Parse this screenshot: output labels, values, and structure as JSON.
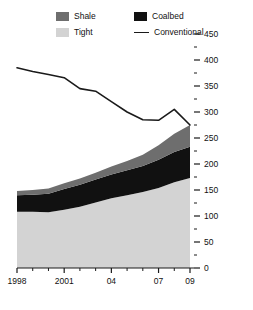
{
  "chart_data": {
    "type": "area",
    "title": "",
    "subtitle": "",
    "xlabel": "",
    "ylabel": "",
    "stacked": true,
    "grid": false,
    "legend_position": "top",
    "x": [
      1998,
      1999,
      2000,
      2001,
      2002,
      2003,
      2004,
      2005,
      2006,
      2007,
      2008,
      2009
    ],
    "xtick_values": [
      1998,
      2001,
      2004,
      2007,
      2009
    ],
    "xtick_labels": [
      "1998",
      "2001",
      "04",
      "07",
      "09"
    ],
    "xlim": [
      1998,
      2009
    ],
    "ylim": [
      0,
      450
    ],
    "ytick_values": [
      0,
      50,
      100,
      150,
      200,
      250,
      300,
      350,
      400,
      450
    ],
    "ytick_labels": [
      "0",
      "50",
      "100",
      "150",
      "200",
      "250",
      "300",
      "350",
      "400",
      "450"
    ],
    "yminor_step": 25,
    "series": [
      {
        "name": "Tight",
        "type": "area",
        "color": "#d3d3d3",
        "values": [
          108,
          108,
          107,
          112,
          118,
          126,
          134,
          140,
          146,
          154,
          165,
          173
        ]
      },
      {
        "name": "Coalbed",
        "type": "area",
        "color": "#111111",
        "values": [
          32,
          33,
          36,
          40,
          42,
          44,
          46,
          48,
          50,
          54,
          58,
          60
        ]
      },
      {
        "name": "Shale",
        "type": "area",
        "color": "#6e6e6e",
        "values": [
          8,
          9,
          10,
          11,
          12,
          13,
          15,
          18,
          22,
          28,
          35,
          42
        ]
      },
      {
        "name": "Conventional",
        "type": "line",
        "color": "#1a1a1a",
        "values": [
          385,
          378,
          372,
          366,
          345,
          340,
          320,
          300,
          285,
          284,
          305,
          275
        ]
      }
    ]
  },
  "legend": {
    "items": [
      {
        "label": "Shale",
        "marker": "swatch",
        "color": "#6e6e6e"
      },
      {
        "label": "Tight",
        "marker": "swatch",
        "color": "#d3d3d3"
      },
      {
        "label": "Coalbed",
        "marker": "swatch",
        "color": "#111111"
      },
      {
        "label": "Conventional",
        "marker": "line",
        "color": "#1a1a1a"
      }
    ]
  }
}
